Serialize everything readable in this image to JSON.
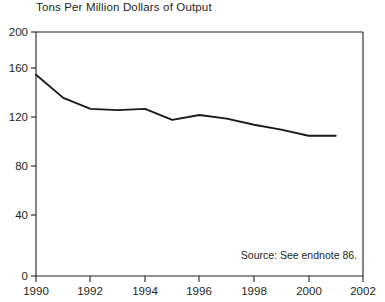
{
  "chart_data": {
    "type": "line",
    "title": "Tons Per Million Dollars of Output",
    "xlabel": "",
    "ylabel": "",
    "xlim": [
      1990,
      2002
    ],
    "ylim": [
      0,
      200
    ],
    "xticks": [
      1990,
      1992,
      1994,
      1996,
      1998,
      2000,
      2002
    ],
    "yticks": [
      0,
      40,
      80,
      120,
      160,
      200
    ],
    "grid": false,
    "legend": null,
    "x": [
      1990,
      1991,
      1992,
      1993,
      1994,
      1995,
      1996,
      1997,
      1998,
      1999,
      2000,
      2001
    ],
    "values": [
      165,
      146,
      137,
      136,
      137,
      128,
      132,
      129,
      124,
      120,
      115,
      115
    ],
    "series": [
      {
        "name": "Tons Per Million Dollars of Output",
        "values": [
          165,
          146,
          137,
          136,
          137,
          128,
          132,
          129,
          124,
          120,
          115,
          115
        ]
      }
    ],
    "annotations": [
      {
        "text": "Source: See endnote 86.",
        "position": "bottom-right"
      }
    ],
    "line_color": "#1a1a1a",
    "axis_color": "#231f20"
  },
  "labels": {
    "title": "Tons Per Million Dollars of Output",
    "source_note": "Source: See endnote 86.",
    "y_ticks": [
      "200",
      "160",
      "120",
      "80",
      "40",
      "0"
    ],
    "x_ticks": [
      "1990",
      "1992",
      "1994",
      "1996",
      "1998",
      "2000",
      "2002"
    ]
  }
}
